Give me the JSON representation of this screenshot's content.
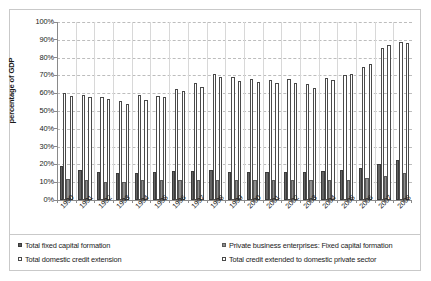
{
  "chart_data": {
    "type": "bar",
    "title": "",
    "xlabel": "",
    "ylabel": "percentage of GDP",
    "ylim": [
      0,
      100
    ],
    "ytick_labels": [
      "100%",
      "90%",
      "80%",
      "70%",
      "60%",
      "50%",
      "40%",
      "30%",
      "20%",
      "10%",
      "0%"
    ],
    "ytick_values": [
      100,
      90,
      80,
      70,
      60,
      50,
      40,
      30,
      20,
      10,
      0
    ],
    "grid": true,
    "legend_position": "bottom",
    "categories": [
      "1990",
      "1991",
      "1992",
      "1993",
      "1994",
      "1995",
      "1996",
      "1997",
      "1998",
      "1999",
      "2000",
      "2001",
      "2002",
      "2003",
      "2004",
      "2005",
      "2006",
      "2007",
      "2008"
    ],
    "series": [
      {
        "name": "Total fixed capital formation",
        "key": "s1",
        "color": "#636363",
        "values": [
          19,
          17,
          16,
          15,
          15,
          16,
          16.5,
          16.5,
          17,
          16,
          15.5,
          15.5,
          15.5,
          16,
          16.5,
          17,
          18,
          20,
          22.5
        ]
      },
      {
        "name": "Total domestic credit extension",
        "key": "s2",
        "color": "#ffffff",
        "values": [
          60,
          59,
          58,
          55.5,
          59,
          58.5,
          62.5,
          66,
          71,
          69,
          68,
          67.5,
          68,
          65,
          68.5,
          70,
          75,
          85.5,
          88.5
        ]
      },
      {
        "name": "Private business enterprises: Fixed capital formation",
        "key": "s3",
        "color": "#8e8e8e",
        "values": [
          12,
          11,
          10,
          10,
          11,
          11.5,
          11.5,
          11.5,
          11.5,
          11,
          11,
          11,
          11,
          11,
          11,
          11.5,
          12.5,
          13.5,
          15
        ]
      },
      {
        "name": "Total credit extended to domestic private sector",
        "key": "s4",
        "color": "#ffffff",
        "values": [
          58.5,
          58,
          56.5,
          54,
          56,
          58,
          61,
          63.5,
          69,
          67,
          66.5,
          66,
          65.5,
          63,
          67.5,
          71,
          76.5,
          87,
          88
        ]
      }
    ],
    "legend_entries": [
      {
        "label": "Total fixed capital formation",
        "key": "s1"
      },
      {
        "label": "Total domestic credit extension",
        "key": "s2"
      },
      {
        "label": "Private business enterprises: Fixed capital formation",
        "key": "s3"
      },
      {
        "label": "Total credit extended to domestic private sector",
        "key": "s4"
      }
    ]
  }
}
